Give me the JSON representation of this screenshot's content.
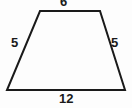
{
  "figure": {
    "name": "trapezoid",
    "shape_type": "isosceles trapezoid",
    "stroke_color": "#1a1a1a",
    "background_color": "#fdfdfd",
    "label_color": "#1a1a1a",
    "vertices": {
      "top_left": [
        40,
        11
      ],
      "top_right": [
        100,
        11
      ],
      "bottom_right": [
        125,
        90
      ],
      "bottom_left": [
        7,
        90
      ]
    },
    "labels": {
      "top": "6",
      "left": "5",
      "right": "5",
      "bottom": "12"
    },
    "sides": [
      {
        "name": "top-side",
        "label": "6"
      },
      {
        "name": "left-side",
        "label": "5"
      },
      {
        "name": "right-side",
        "label": "5"
      },
      {
        "name": "bottom-side",
        "label": "12"
      }
    ]
  }
}
